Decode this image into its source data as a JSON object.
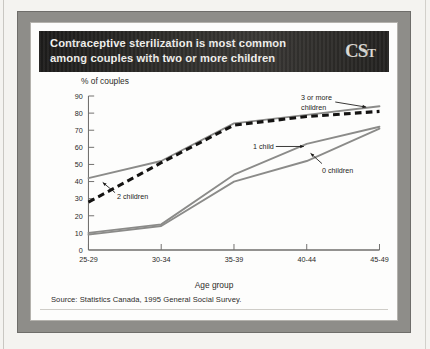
{
  "figure": {
    "title_line1": "Contraceptive sterilization is most common",
    "title_line2": "among couples with two or more children",
    "logo_text": "CST",
    "source": "Source: Statistics Canada, 1995 General Social Survey."
  },
  "colors": {
    "banner_bg": "#262523",
    "banner_text": "#f3f2ef",
    "frame_gray": "#8e8d89",
    "panel_white": "#fdfdfc",
    "solid_line": "#8b8b89",
    "dashed_line": "#141312",
    "axis": "#6f6e6c",
    "text": "#2b2a28"
  },
  "chart_data": {
    "type": "line",
    "title": "Contraceptive sterilization is most common among couples with two or more children",
    "xlabel": "Age group",
    "ylabel": "% of couples",
    "categories": [
      "25-29",
      "30-34",
      "35-39",
      "40-44",
      "45-49"
    ],
    "ylim": [
      0,
      90
    ],
    "yticks": [
      0,
      10,
      20,
      30,
      40,
      50,
      60,
      70,
      80,
      90
    ],
    "grid": false,
    "legend": "annotations",
    "series": [
      {
        "name": "3 or more children",
        "style": "solid",
        "color": "#8b8b89",
        "values": [
          42,
          52,
          74,
          79,
          84
        ]
      },
      {
        "name": "2 children",
        "style": "dashed",
        "color": "#141312",
        "values": [
          28,
          51,
          73,
          78,
          81
        ]
      },
      {
        "name": "1 child",
        "style": "solid",
        "color": "#8b8b89",
        "values": [
          10,
          15,
          44,
          62,
          72
        ]
      },
      {
        "name": "0 children",
        "style": "solid",
        "color": "#8b8b89",
        "values": [
          9,
          14,
          40,
          52,
          71
        ]
      }
    ],
    "annotations": [
      {
        "text_line1": "3 or more",
        "text_line2": "children",
        "points_to": "3 or more children"
      },
      {
        "text_line1": "2 children",
        "text_line2": "",
        "points_to": "2 children"
      },
      {
        "text_line1": "1 child",
        "text_line2": "",
        "points_to": "1 child"
      },
      {
        "text_line1": "0 children",
        "text_line2": "",
        "points_to": "0 children"
      }
    ]
  }
}
